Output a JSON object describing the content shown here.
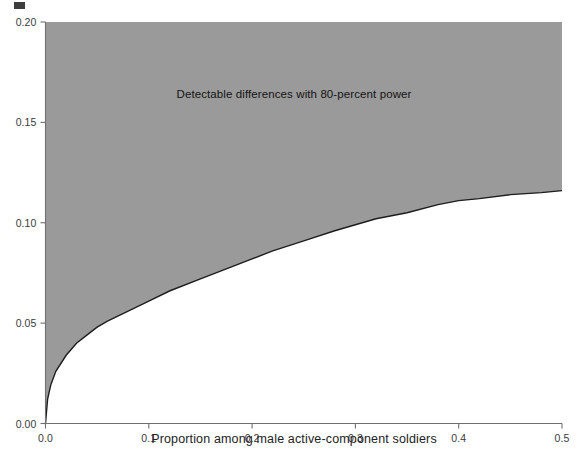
{
  "chart_data": {
    "type": "area",
    "title": "",
    "subtitle": "",
    "xlabel": "Proportion among male active-component soldiers",
    "ylabel": "",
    "xlim": [
      0.0,
      0.5
    ],
    "ylim": [
      0.0,
      0.2
    ],
    "xticks": [
      "0.0",
      "0.1",
      "0.2",
      "0.3",
      "0.4",
      "0.5"
    ],
    "xtick_values": [
      0.0,
      0.1,
      0.2,
      0.3,
      0.4,
      0.5
    ],
    "yticks": [
      "0.00",
      "0.05",
      "0.10",
      "0.15",
      "0.20"
    ],
    "ytick_values": [
      0.0,
      0.05,
      0.1,
      0.15,
      0.2
    ],
    "grid": false,
    "legend": null,
    "annotations": [
      {
        "text": "Detectable differences with 80-percent power",
        "x": 0.25,
        "y": 0.167
      }
    ],
    "shaded_region": {
      "label": "Detectable differences with 80-percent power",
      "fill_color": "#9a9a9a",
      "boundary_color": "#1d1d1d",
      "description": "Region above the minimum-detectable-difference curve",
      "fill_side": "above"
    },
    "x": [
      0.0,
      0.002,
      0.005,
      0.01,
      0.02,
      0.03,
      0.04,
      0.05,
      0.06,
      0.08,
      0.1,
      0.12,
      0.15,
      0.18,
      0.2,
      0.22,
      0.25,
      0.28,
      0.3,
      0.32,
      0.35,
      0.38,
      0.4,
      0.42,
      0.45,
      0.48,
      0.5
    ],
    "y": [
      0.0,
      0.012,
      0.019,
      0.026,
      0.034,
      0.04,
      0.044,
      0.048,
      0.051,
      0.056,
      0.061,
      0.066,
      0.072,
      0.078,
      0.082,
      0.086,
      0.091,
      0.096,
      0.099,
      0.102,
      0.105,
      0.109,
      0.111,
      0.112,
      0.114,
      0.115,
      0.116
    ],
    "series": [
      {
        "name": "Minimum detectable difference (80% power)",
        "values": [
          0.0,
          0.012,
          0.019,
          0.026,
          0.034,
          0.04,
          0.044,
          0.048,
          0.051,
          0.056,
          0.061,
          0.066,
          0.072,
          0.078,
          0.082,
          0.086,
          0.091,
          0.096,
          0.099,
          0.102,
          0.105,
          0.109,
          0.111,
          0.112,
          0.114,
          0.115,
          0.116
        ]
      }
    ],
    "colors": {
      "fill": "#9a9a9a",
      "curve": "#1d1d1d",
      "axis": "#6f6f6f",
      "text": "#222222"
    }
  }
}
